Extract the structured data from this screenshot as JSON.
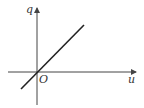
{
  "diagram": {
    "type": "line-graph-sketch",
    "axes": {
      "x_label": "u",
      "y_label": "q",
      "origin_label": "O"
    },
    "series": [
      {
        "name": "q vs u",
        "relation": "proportional",
        "from": [
          -1,
          -1
        ],
        "to": [
          3,
          3
        ]
      }
    ],
    "colors": {
      "axis": "#444444",
      "line": "#222222",
      "background": "#ffffff"
    }
  }
}
